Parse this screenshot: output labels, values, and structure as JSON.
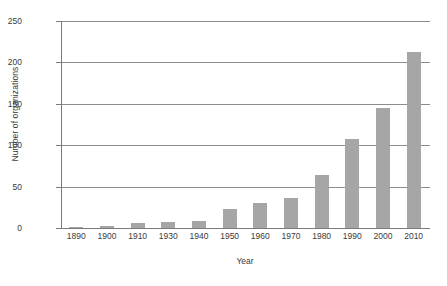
{
  "chart_data": {
    "type": "bar",
    "title": "",
    "xlabel": "Year",
    "ylabel": "Number of organizations",
    "categories": [
      "1890",
      "1900",
      "1910",
      "1930",
      "1940",
      "1950",
      "1960",
      "1970",
      "1980",
      "1990",
      "2000",
      "2010"
    ],
    "values": [
      1,
      3,
      6,
      7,
      8,
      23,
      30,
      36,
      64,
      108,
      145,
      212
    ],
    "ylim": [
      0,
      250
    ],
    "yticks": [
      0,
      50,
      100,
      150,
      200,
      250
    ],
    "ytick_labels": [
      "0",
      "50",
      "100",
      "150",
      "200",
      "250"
    ],
    "grid": "horizontal",
    "legend": "none",
    "series": [
      {
        "name": "Number of organizations",
        "color": "#a6a6a6",
        "values": [
          1,
          3,
          6,
          7,
          8,
          23,
          30,
          36,
          64,
          108,
          145,
          212
        ]
      }
    ]
  },
  "colors": {
    "bar": "#a6a6a6",
    "axis": "#7a7a7a",
    "gridline": "#8c8c8c",
    "text": "#3a3a3a",
    "background": "#ffffff"
  }
}
